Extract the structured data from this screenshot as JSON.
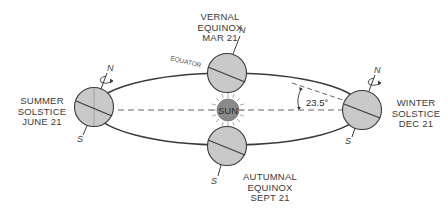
{
  "diagram": {
    "colors": {
      "globe_fill": "#c9c9c9",
      "line": "#3a3a3a",
      "sun_fill": "#8a8a8a",
      "text": "#3a3a3a",
      "background": "#ffffff"
    },
    "positions": {
      "vernal": {
        "name": "VERNAL",
        "type": "EQUINOX",
        "date": "MAR 21"
      },
      "summer": {
        "name": "SUMMER",
        "type": "SOLSTICE",
        "date": "JUNE 21"
      },
      "autumnal": {
        "name": "AUTUMNAL",
        "type": "EQUINOX",
        "date": "SEPT 21"
      },
      "winter": {
        "name": "WINTER",
        "type": "SOLSTICE",
        "date": "DEC 21"
      }
    },
    "sun_label": "SUN",
    "equator_label": "EQUATOR",
    "tilt_label": "23.5°",
    "north_label": "N",
    "south_label": "S"
  }
}
